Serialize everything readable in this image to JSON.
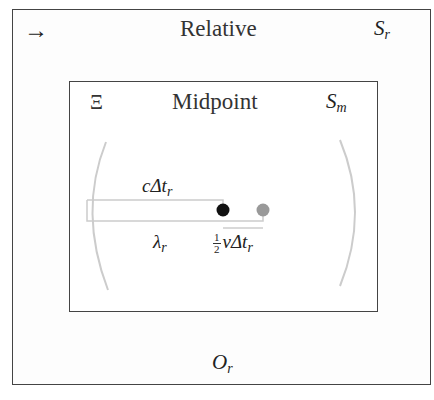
{
  "outer_frame": {
    "title": "Relative",
    "symbol_left": "→",
    "frame_label": "S",
    "frame_label_sub": "r",
    "observer": "O",
    "observer_sub": "r"
  },
  "inner_frame": {
    "title": "Midpoint",
    "symbol_left": "Ξ",
    "frame_label": "S",
    "frame_label_sub": "m"
  },
  "diagram": {
    "top_segment_label": "cΔt",
    "top_segment_label_sub": "r",
    "bottom_segment_label": "λ",
    "bottom_segment_label_sub": "r",
    "offset_label_num": "1",
    "offset_label_den": "2",
    "offset_label": "vΔt",
    "offset_label_sub": "r",
    "points": [
      {
        "name": "midpoint",
        "color": "#111111"
      },
      {
        "name": "source",
        "color": "#999999"
      }
    ],
    "arc_color": "#cccccc",
    "line_color": "#cccccc"
  }
}
